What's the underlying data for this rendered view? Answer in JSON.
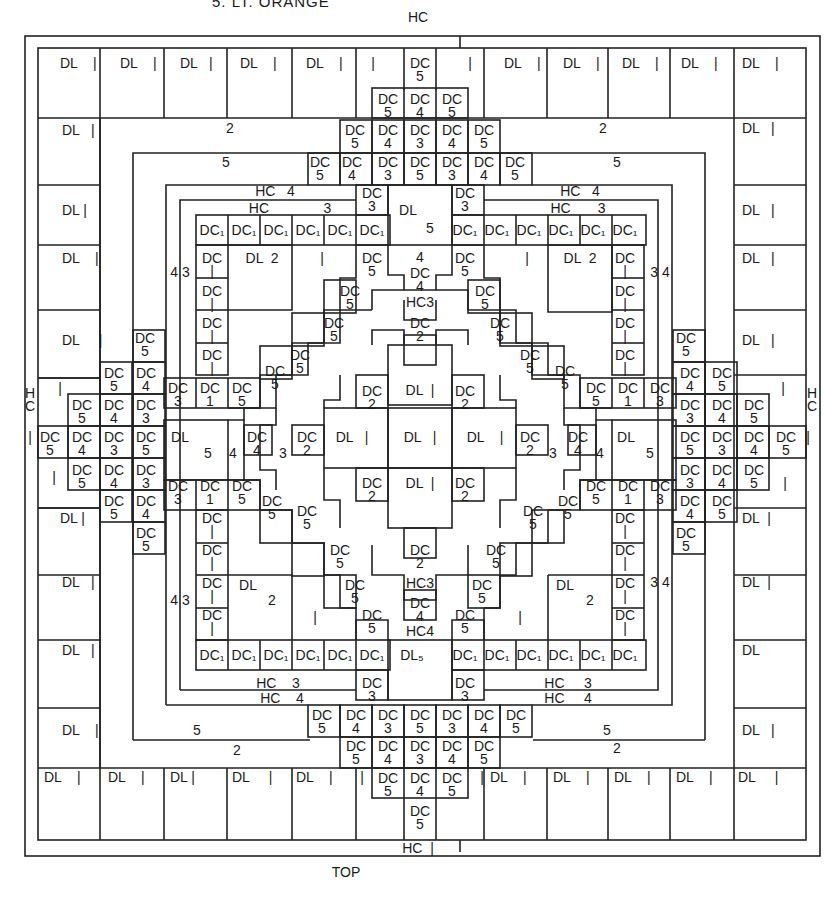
{
  "header": {
    "caption": "5. LT. ORANGE"
  },
  "footer": {
    "caption": "TOP"
  },
  "legend_codes": {
    "DL": "DL",
    "DC": "DC",
    "HC": "HC"
  },
  "labels": [
    {
      "x": 418,
      "y": 17,
      "t": "HC"
    },
    {
      "x": 418,
      "y": 848,
      "t": "HC  |"
    },
    {
      "x": 346,
      "y": 872,
      "t": "TOP"
    },
    {
      "x": 30,
      "y": 400,
      "t": "H\nC"
    },
    {
      "x": 812,
      "y": 400,
      "t": "H\nC"
    },
    {
      "x": 60,
      "y": 63,
      "t": "DL    |",
      "l": 1
    },
    {
      "x": 120,
      "y": 63,
      "t": "DL    |",
      "l": 1
    },
    {
      "x": 180,
      "y": 63,
      "t": "DL   |",
      "l": 1
    },
    {
      "x": 240,
      "y": 63,
      "t": "DL    |",
      "l": 1
    },
    {
      "x": 306,
      "y": 63,
      "t": "DL    |",
      "l": 1
    },
    {
      "x": 373,
      "y": 63,
      "t": "|"
    },
    {
      "x": 420,
      "y": 70,
      "t": "DC\n5"
    },
    {
      "x": 470,
      "y": 63,
      "t": "|"
    },
    {
      "x": 504,
      "y": 63,
      "t": "DL    |",
      "l": 1
    },
    {
      "x": 563,
      "y": 63,
      "t": "DL    |",
      "l": 1
    },
    {
      "x": 622,
      "y": 63,
      "t": "DL    |",
      "l": 1
    },
    {
      "x": 681,
      "y": 63,
      "t": "DL    |",
      "l": 1
    },
    {
      "x": 742,
      "y": 63,
      "t": "DL    |",
      "l": 1
    },
    {
      "x": 388,
      "y": 106,
      "t": "DC\n5"
    },
    {
      "x": 420,
      "y": 106,
      "t": "DC\n4"
    },
    {
      "x": 452,
      "y": 106,
      "t": "DC\n5"
    },
    {
      "x": 62,
      "y": 130,
      "t": "DL   |",
      "l": 1
    },
    {
      "x": 230,
      "y": 128,
      "t": "2"
    },
    {
      "x": 355,
      "y": 137,
      "t": "DC\n5"
    },
    {
      "x": 388,
      "y": 137,
      "t": "DC\n4"
    },
    {
      "x": 420,
      "y": 137,
      "t": "DC\n3"
    },
    {
      "x": 452,
      "y": 137,
      "t": "DC\n4"
    },
    {
      "x": 484,
      "y": 137,
      "t": "DC\n5"
    },
    {
      "x": 603,
      "y": 128,
      "t": "2"
    },
    {
      "x": 742,
      "y": 128,
      "t": "DL   |",
      "l": 1
    },
    {
      "x": 226,
      "y": 162,
      "t": "5"
    },
    {
      "x": 320,
      "y": 169,
      "t": "DC\n5"
    },
    {
      "x": 352,
      "y": 169,
      "t": "DC\n4"
    },
    {
      "x": 388,
      "y": 169,
      "t": "DC\n3"
    },
    {
      "x": 420,
      "y": 169,
      "t": "DC\n5"
    },
    {
      "x": 452,
      "y": 169,
      "t": "DC\n3"
    },
    {
      "x": 484,
      "y": 169,
      "t": "DC\n4"
    },
    {
      "x": 515,
      "y": 169,
      "t": "DC\n5"
    },
    {
      "x": 617,
      "y": 162,
      "t": "5"
    },
    {
      "x": 275,
      "y": 191,
      "t": "HC   4"
    },
    {
      "x": 372,
      "y": 200,
      "t": "DC\n3"
    },
    {
      "x": 465,
      "y": 200,
      "t": "DC\n3"
    },
    {
      "x": 408,
      "y": 210,
      "t": "DL"
    },
    {
      "x": 580,
      "y": 191,
      "t": "HC   4"
    },
    {
      "x": 62,
      "y": 210,
      "t": "DL |",
      "l": 1
    },
    {
      "x": 742,
      "y": 210,
      "t": "DL   |",
      "l": 1
    },
    {
      "x": 290,
      "y": 208,
      "t": "HC              3"
    },
    {
      "x": 578,
      "y": 208,
      "t": "HC       3"
    },
    {
      "x": 430,
      "y": 228,
      "t": "5"
    },
    {
      "x": 212,
      "y": 230,
      "t": "DC₁"
    },
    {
      "x": 244,
      "y": 230,
      "t": "DC₁"
    },
    {
      "x": 276,
      "y": 230,
      "t": "DC₁"
    },
    {
      "x": 308,
      "y": 230,
      "t": "DC₁"
    },
    {
      "x": 340,
      "y": 230,
      "t": "DC₁"
    },
    {
      "x": 372,
      "y": 230,
      "t": "DC₁"
    },
    {
      "x": 465,
      "y": 230,
      "t": "DC₁"
    },
    {
      "x": 497,
      "y": 230,
      "t": "DC₁"
    },
    {
      "x": 529,
      "y": 230,
      "t": "DC₁"
    },
    {
      "x": 561,
      "y": 230,
      "t": "DC₁"
    },
    {
      "x": 593,
      "y": 230,
      "t": "DC₁"
    },
    {
      "x": 625,
      "y": 230,
      "t": "DC₁"
    },
    {
      "x": 62,
      "y": 258,
      "t": "DL    |",
      "l": 1
    },
    {
      "x": 180,
      "y": 272,
      "t": "4 3"
    },
    {
      "x": 212,
      "y": 265,
      "t": "DC\n|"
    },
    {
      "x": 262,
      "y": 258,
      "t": "DL  2"
    },
    {
      "x": 322,
      "y": 258,
      "t": "|"
    },
    {
      "x": 372,
      "y": 265,
      "t": "DC\n5"
    },
    {
      "x": 420,
      "y": 257,
      "t": "4"
    },
    {
      "x": 420,
      "y": 280,
      "t": "DC\n4"
    },
    {
      "x": 465,
      "y": 265,
      "t": "DC\n5"
    },
    {
      "x": 527,
      "y": 258,
      "t": "|"
    },
    {
      "x": 580,
      "y": 258,
      "t": "DL  2"
    },
    {
      "x": 625,
      "y": 265,
      "t": "DC\n|"
    },
    {
      "x": 660,
      "y": 272,
      "t": "3 4"
    },
    {
      "x": 742,
      "y": 258,
      "t": "DL   |",
      "l": 1
    },
    {
      "x": 212,
      "y": 298,
      "t": "DC\n|"
    },
    {
      "x": 350,
      "y": 298,
      "t": "DC\n5"
    },
    {
      "x": 420,
      "y": 302,
      "t": "HC3"
    },
    {
      "x": 485,
      "y": 298,
      "t": "DC\n5"
    },
    {
      "x": 625,
      "y": 298,
      "t": "DC\n|"
    },
    {
      "x": 62,
      "y": 340,
      "t": "DL     |",
      "l": 1
    },
    {
      "x": 145,
      "y": 345,
      "t": "DC\n5"
    },
    {
      "x": 212,
      "y": 330,
      "t": "DC\n|"
    },
    {
      "x": 334,
      "y": 330,
      "t": "DC\n5"
    },
    {
      "x": 420,
      "y": 330,
      "t": "DC\n2"
    },
    {
      "x": 500,
      "y": 330,
      "t": "DC\n5"
    },
    {
      "x": 625,
      "y": 330,
      "t": "DC\n|"
    },
    {
      "x": 686,
      "y": 345,
      "t": "DC\n5"
    },
    {
      "x": 742,
      "y": 340,
      "t": "DL   |",
      "l": 1
    },
    {
      "x": 212,
      "y": 362,
      "t": "DC\n|"
    },
    {
      "x": 300,
      "y": 362,
      "t": "DC\n5"
    },
    {
      "x": 530,
      "y": 362,
      "t": "DC\n5"
    },
    {
      "x": 625,
      "y": 362,
      "t": "DC\n|"
    },
    {
      "x": 60,
      "y": 388,
      "t": "|"
    },
    {
      "x": 114,
      "y": 380,
      "t": "DC\n5"
    },
    {
      "x": 146,
      "y": 380,
      "t": "DC\n4"
    },
    {
      "x": 178,
      "y": 395,
      "t": "DC\n3"
    },
    {
      "x": 210,
      "y": 395,
      "t": "DC\n1"
    },
    {
      "x": 242,
      "y": 395,
      "t": "DC\n5"
    },
    {
      "x": 275,
      "y": 378,
      "t": "DC\n5"
    },
    {
      "x": 565,
      "y": 378,
      "t": "DC\n5"
    },
    {
      "x": 596,
      "y": 395,
      "t": "DC\n5"
    },
    {
      "x": 628,
      "y": 395,
      "t": "DC\n1"
    },
    {
      "x": 660,
      "y": 395,
      "t": "DC\n3"
    },
    {
      "x": 690,
      "y": 380,
      "t": "DC\n4"
    },
    {
      "x": 722,
      "y": 380,
      "t": "DC\n5"
    },
    {
      "x": 783,
      "y": 388,
      "t": "|"
    },
    {
      "x": 372,
      "y": 398,
      "t": "DC\n2"
    },
    {
      "x": 420,
      "y": 390,
      "t": "DL  |"
    },
    {
      "x": 465,
      "y": 398,
      "t": "DC\n2"
    },
    {
      "x": 82,
      "y": 412,
      "t": "DC\n5"
    },
    {
      "x": 114,
      "y": 412,
      "t": "DC\n4"
    },
    {
      "x": 146,
      "y": 412,
      "t": "DC\n3"
    },
    {
      "x": 690,
      "y": 412,
      "t": "DC\n3"
    },
    {
      "x": 722,
      "y": 412,
      "t": "DC\n4"
    },
    {
      "x": 754,
      "y": 412,
      "t": "DC\n5"
    },
    {
      "x": 30,
      "y": 437,
      "t": "|"
    },
    {
      "x": 50,
      "y": 444,
      "t": "DC\n5"
    },
    {
      "x": 82,
      "y": 444,
      "t": "DC\n4"
    },
    {
      "x": 114,
      "y": 444,
      "t": "DC\n3"
    },
    {
      "x": 146,
      "y": 444,
      "t": "DC\n5"
    },
    {
      "x": 180,
      "y": 437,
      "t": "DL"
    },
    {
      "x": 208,
      "y": 453,
      "t": "5"
    },
    {
      "x": 233,
      "y": 453,
      "t": "4"
    },
    {
      "x": 257,
      "y": 444,
      "t": "DC\n4"
    },
    {
      "x": 283,
      "y": 453,
      "t": "3"
    },
    {
      "x": 307,
      "y": 444,
      "t": "DC\n2"
    },
    {
      "x": 352,
      "y": 437,
      "t": "DL   |"
    },
    {
      "x": 420,
      "y": 437,
      "t": "DL   |"
    },
    {
      "x": 485,
      "y": 437,
      "t": "DL    |"
    },
    {
      "x": 530,
      "y": 444,
      "t": "DC\n2"
    },
    {
      "x": 553,
      "y": 453,
      "t": "3"
    },
    {
      "x": 578,
      "y": 444,
      "t": "DC\n4"
    },
    {
      "x": 600,
      "y": 453,
      "t": "4"
    },
    {
      "x": 626,
      "y": 437,
      "t": "DL"
    },
    {
      "x": 650,
      "y": 453,
      "t": "5"
    },
    {
      "x": 690,
      "y": 444,
      "t": "DC\n5"
    },
    {
      "x": 722,
      "y": 444,
      "t": "DC\n3"
    },
    {
      "x": 754,
      "y": 444,
      "t": "DC\n4"
    },
    {
      "x": 786,
      "y": 444,
      "t": "DC\n5"
    },
    {
      "x": 808,
      "y": 437,
      "t": "|"
    },
    {
      "x": 54,
      "y": 477,
      "t": "|"
    },
    {
      "x": 82,
      "y": 477,
      "t": "DC\n5"
    },
    {
      "x": 114,
      "y": 477,
      "t": "DC\n4"
    },
    {
      "x": 146,
      "y": 477,
      "t": "DC\n3"
    },
    {
      "x": 178,
      "y": 493,
      "t": "DC\n3"
    },
    {
      "x": 210,
      "y": 493,
      "t": "DC\n1"
    },
    {
      "x": 242,
      "y": 493,
      "t": "DC\n5"
    },
    {
      "x": 372,
      "y": 490,
      "t": "DC\n2"
    },
    {
      "x": 420,
      "y": 483,
      "t": "DL  |"
    },
    {
      "x": 465,
      "y": 490,
      "t": "DC\n2"
    },
    {
      "x": 596,
      "y": 493,
      "t": "DC\n5"
    },
    {
      "x": 628,
      "y": 493,
      "t": "DC\n1"
    },
    {
      "x": 660,
      "y": 493,
      "t": "DC\n3"
    },
    {
      "x": 690,
      "y": 477,
      "t": "DC\n3"
    },
    {
      "x": 722,
      "y": 477,
      "t": "DC\n4"
    },
    {
      "x": 754,
      "y": 477,
      "t": "DC\n5"
    },
    {
      "x": 785,
      "y": 483,
      "t": "|"
    },
    {
      "x": 114,
      "y": 508,
      "t": "DC\n5"
    },
    {
      "x": 146,
      "y": 508,
      "t": "DC\n4"
    },
    {
      "x": 272,
      "y": 508,
      "t": "DC\n5"
    },
    {
      "x": 307,
      "y": 518,
      "t": "DC\n5"
    },
    {
      "x": 533,
      "y": 518,
      "t": "DC\n5"
    },
    {
      "x": 568,
      "y": 508,
      "t": "DC\n5"
    },
    {
      "x": 690,
      "y": 508,
      "t": "DC\n4"
    },
    {
      "x": 722,
      "y": 508,
      "t": "DC\n5"
    },
    {
      "x": 60,
      "y": 518,
      "t": "DL |",
      "l": 1
    },
    {
      "x": 742,
      "y": 518,
      "t": "DL  |",
      "l": 1
    },
    {
      "x": 146,
      "y": 540,
      "t": "DC\n5"
    },
    {
      "x": 212,
      "y": 525,
      "t": "DC\n|"
    },
    {
      "x": 625,
      "y": 525,
      "t": "DC\n|"
    },
    {
      "x": 686,
      "y": 540,
      "t": "DC\n5"
    },
    {
      "x": 212,
      "y": 557,
      "t": "DC\n|"
    },
    {
      "x": 340,
      "y": 557,
      "t": "DC\n5"
    },
    {
      "x": 420,
      "y": 557,
      "t": "DC\n2"
    },
    {
      "x": 496,
      "y": 557,
      "t": "DC\n5"
    },
    {
      "x": 625,
      "y": 557,
      "t": "DC\n|"
    },
    {
      "x": 62,
      "y": 582,
      "t": "DL   |",
      "l": 1
    },
    {
      "x": 180,
      "y": 600,
      "t": "4 3"
    },
    {
      "x": 212,
      "y": 590,
      "t": "DC\n|"
    },
    {
      "x": 248,
      "y": 585,
      "t": "DL"
    },
    {
      "x": 272,
      "y": 600,
      "t": "2"
    },
    {
      "x": 355,
      "y": 592,
      "t": "DC\n5"
    },
    {
      "x": 420,
      "y": 583,
      "t": "HC3"
    },
    {
      "x": 482,
      "y": 592,
      "t": "DC\n5"
    },
    {
      "x": 565,
      "y": 585,
      "t": "DL"
    },
    {
      "x": 590,
      "y": 600,
      "t": "2"
    },
    {
      "x": 625,
      "y": 590,
      "t": "DC\n|"
    },
    {
      "x": 660,
      "y": 582,
      "t": "3 4"
    },
    {
      "x": 742,
      "y": 582,
      "t": "DL  |",
      "l": 1
    },
    {
      "x": 212,
      "y": 622,
      "t": "DC\n|"
    },
    {
      "x": 315,
      "y": 617,
      "t": "|"
    },
    {
      "x": 372,
      "y": 622,
      "t": "DC\n5"
    },
    {
      "x": 420,
      "y": 610,
      "t": "DC\n4"
    },
    {
      "x": 420,
      "y": 631,
      "t": "HC4"
    },
    {
      "x": 465,
      "y": 622,
      "t": "DC\n5"
    },
    {
      "x": 520,
      "y": 617,
      "t": "|"
    },
    {
      "x": 625,
      "y": 622,
      "t": "DC\n|"
    },
    {
      "x": 62,
      "y": 650,
      "t": "DL   |",
      "l": 1
    },
    {
      "x": 212,
      "y": 655,
      "t": "DC₁"
    },
    {
      "x": 244,
      "y": 655,
      "t": "DC₁"
    },
    {
      "x": 276,
      "y": 655,
      "t": "DC₁"
    },
    {
      "x": 308,
      "y": 655,
      "t": "DC₁"
    },
    {
      "x": 340,
      "y": 655,
      "t": "DC₁"
    },
    {
      "x": 372,
      "y": 655,
      "t": "DC₁"
    },
    {
      "x": 412,
      "y": 655,
      "t": "DL₅"
    },
    {
      "x": 465,
      "y": 655,
      "t": "DC₁"
    },
    {
      "x": 497,
      "y": 655,
      "t": "DC₁"
    },
    {
      "x": 529,
      "y": 655,
      "t": "DC₁"
    },
    {
      "x": 561,
      "y": 655,
      "t": "DC₁"
    },
    {
      "x": 593,
      "y": 655,
      "t": "DC₁"
    },
    {
      "x": 625,
      "y": 655,
      "t": "DC₁"
    },
    {
      "x": 742,
      "y": 650,
      "t": "DL",
      "l": 1
    },
    {
      "x": 278,
      "y": 683,
      "t": "HC    3"
    },
    {
      "x": 282,
      "y": 698,
      "t": "HC    4"
    },
    {
      "x": 372,
      "y": 690,
      "t": "DC\n3"
    },
    {
      "x": 465,
      "y": 690,
      "t": "DC\n3"
    },
    {
      "x": 568,
      "y": 683,
      "t": "HC     3"
    },
    {
      "x": 568,
      "y": 698,
      "t": "HC     4"
    },
    {
      "x": 62,
      "y": 730,
      "t": "DL    |",
      "l": 1
    },
    {
      "x": 197,
      "y": 730,
      "t": "5"
    },
    {
      "x": 322,
      "y": 722,
      "t": "DC\n5"
    },
    {
      "x": 356,
      "y": 722,
      "t": "DC\n4"
    },
    {
      "x": 388,
      "y": 722,
      "t": "DC\n3"
    },
    {
      "x": 420,
      "y": 722,
      "t": "DC\n5"
    },
    {
      "x": 452,
      "y": 722,
      "t": "DC\n3"
    },
    {
      "x": 484,
      "y": 722,
      "t": "DC\n4"
    },
    {
      "x": 516,
      "y": 722,
      "t": "DC\n5"
    },
    {
      "x": 607,
      "y": 730,
      "t": "5"
    },
    {
      "x": 742,
      "y": 730,
      "t": "DL   |",
      "l": 1
    },
    {
      "x": 237,
      "y": 750,
      "t": "2"
    },
    {
      "x": 356,
      "y": 753,
      "t": "DC\n5"
    },
    {
      "x": 388,
      "y": 753,
      "t": "DC\n4"
    },
    {
      "x": 420,
      "y": 753,
      "t": "DC\n3"
    },
    {
      "x": 452,
      "y": 753,
      "t": "DC\n4"
    },
    {
      "x": 484,
      "y": 753,
      "t": "DC\n5"
    },
    {
      "x": 617,
      "y": 748,
      "t": "2"
    },
    {
      "x": 44,
      "y": 777,
      "t": "DL    |",
      "l": 1
    },
    {
      "x": 108,
      "y": 777,
      "t": "DL    |",
      "l": 1
    },
    {
      "x": 170,
      "y": 777,
      "t": "DL |",
      "l": 1
    },
    {
      "x": 232,
      "y": 777,
      "t": "DL     |",
      "l": 1
    },
    {
      "x": 296,
      "y": 777,
      "t": "DL    |",
      "l": 1
    },
    {
      "x": 362,
      "y": 777,
      "t": "|"
    },
    {
      "x": 388,
      "y": 785,
      "t": "DC\n5"
    },
    {
      "x": 420,
      "y": 785,
      "t": "DC\n4"
    },
    {
      "x": 452,
      "y": 785,
      "t": "DC\n5"
    },
    {
      "x": 482,
      "y": 777,
      "t": "|"
    },
    {
      "x": 490,
      "y": 777,
      "t": "DL    |",
      "l": 1
    },
    {
      "x": 553,
      "y": 777,
      "t": "DL    |",
      "l": 1
    },
    {
      "x": 614,
      "y": 777,
      "t": "DL    |",
      "l": 1
    },
    {
      "x": 676,
      "y": 777,
      "t": "DL    |",
      "l": 1
    },
    {
      "x": 738,
      "y": 777,
      "t": "DL     |",
      "l": 1
    },
    {
      "x": 420,
      "y": 818,
      "t": "DC\n5"
    }
  ]
}
